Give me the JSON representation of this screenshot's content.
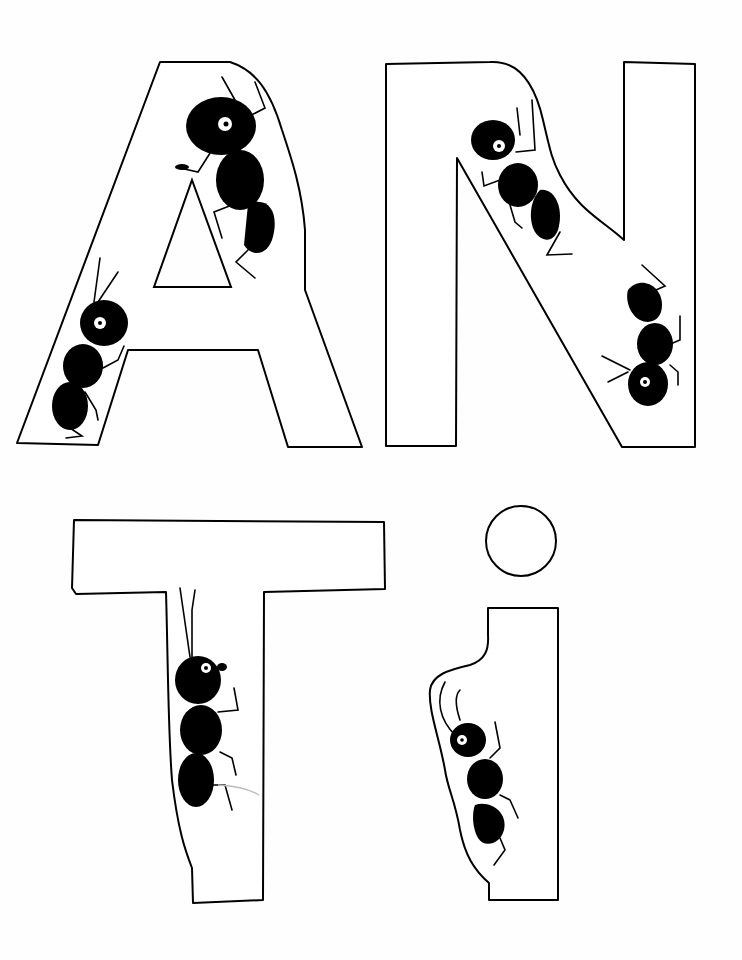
{
  "title": "ANTi",
  "letters": [
    {
      "char": "A",
      "ants": 2
    },
    {
      "char": "N",
      "ants": 2
    },
    {
      "char": "T",
      "ants": 1
    },
    {
      "char": "i",
      "ants": 1
    }
  ],
  "colors": {
    "ink": "#000000",
    "paper": "#fefefe"
  }
}
